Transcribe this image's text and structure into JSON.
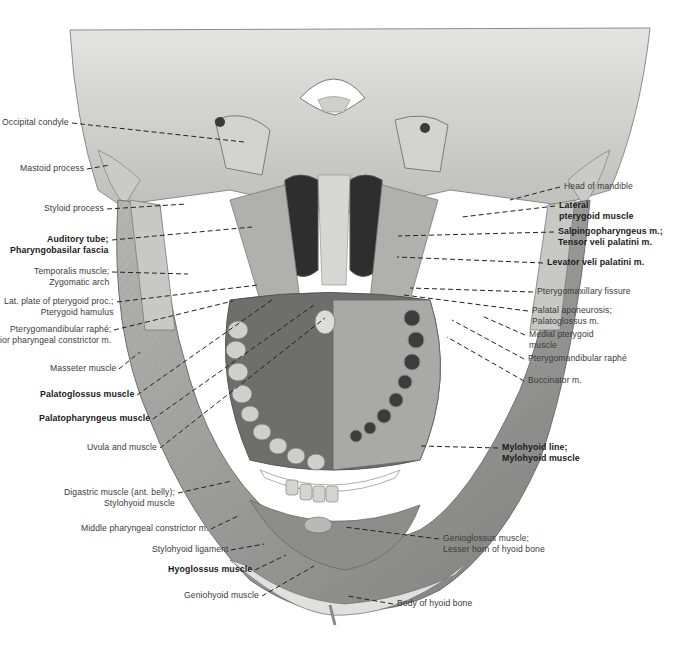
{
  "figure": {
    "colors": {
      "background": "#ffffff",
      "bone": "#d9d9d6",
      "muscle": "#9a9a9a",
      "shadow": "#2b2b2b",
      "text": "#3a3a3a",
      "leader": "#222222"
    }
  },
  "labels_left": [
    {
      "id": "occipital-condyle",
      "lines": [
        "Occipital condyle"
      ],
      "bold": false,
      "x": 2,
      "y": 117,
      "tx": 244,
      "ty": 142
    },
    {
      "id": "mastoid-process",
      "lines": [
        "Mastoid process"
      ],
      "bold": false,
      "x": 20,
      "y": 163,
      "tx": 110,
      "ty": 165
    },
    {
      "id": "styloid-process",
      "lines": [
        "Styloid process"
      ],
      "bold": false,
      "x": 44,
      "y": 203,
      "tx": 187,
      "ty": 204
    },
    {
      "id": "auditory-tube",
      "lines": [
        "Auditory tube;",
        "Pharyngobasilar fascia"
      ],
      "bold": true,
      "x": 10,
      "y": 234,
      "tx": 252,
      "ty": 227
    },
    {
      "id": "temporalis-muscle",
      "lines": [
        "Temporalis muscle;",
        "Zygomatic arch"
      ],
      "bold": false,
      "x": 34,
      "y": 266,
      "tx": 188,
      "ty": 274
    },
    {
      "id": "lat-plate-pterygoid",
      "lines": [
        "Lat. plate of pterygoid proc.;",
        "Pterygoid hamulus"
      ],
      "bold": false,
      "x": 4,
      "y": 296,
      "tx": 258,
      "ty": 285
    },
    {
      "id": "pterygomandibular-raphe-left",
      "lines": [
        "Pterygomandibular raphé;",
        "ior pharyngeal constrictor m."
      ],
      "bold": false,
      "x": 0,
      "y": 324,
      "tx": 233,
      "ty": 301
    },
    {
      "id": "masseter-muscle",
      "lines": [
        "Masseter muscle"
      ],
      "bold": false,
      "x": 50,
      "y": 363,
      "tx": 140,
      "ty": 352
    },
    {
      "id": "palatoglossus-muscle",
      "lines": [
        "Palatoglossus muscle"
      ],
      "bold": true,
      "x": 40,
      "y": 389,
      "tx": 272,
      "ty": 300
    },
    {
      "id": "palatopharyngeus-muscle",
      "lines": [
        "Palatopharyngeus muscle"
      ],
      "bold": true,
      "x": 39,
      "y": 413,
      "tx": 314,
      "ty": 305
    },
    {
      "id": "uvula-and-muscle",
      "lines": [
        "Uvula and muscle"
      ],
      "bold": false,
      "x": 87,
      "y": 442,
      "tx": 325,
      "ty": 318
    },
    {
      "id": "digastric-muscle",
      "lines": [
        "Digastric muscle (ant. belly);",
        "Stylohyoid muscle"
      ],
      "bold": false,
      "x": 64,
      "y": 487,
      "tx": 232,
      "ty": 481
    },
    {
      "id": "middle-pharyngeal-constrictor",
      "lines": [
        "Middle pharyngeal constrictor m."
      ],
      "bold": false,
      "x": 81,
      "y": 523,
      "tx": 240,
      "ty": 515
    },
    {
      "id": "stylohyoid-ligament",
      "lines": [
        "Stylohyoid ligament"
      ],
      "bold": false,
      "x": 152,
      "y": 544,
      "tx": 264,
      "ty": 544
    },
    {
      "id": "hyoglossus-muscle",
      "lines": [
        "Hyoglossus muscle"
      ],
      "bold": true,
      "x": 168,
      "y": 564,
      "tx": 286,
      "ty": 555
    },
    {
      "id": "geniohyoid-muscle",
      "lines": [
        "Geniohyoid muscle"
      ],
      "bold": false,
      "x": 184,
      "y": 590,
      "tx": 314,
      "ty": 566
    }
  ],
  "labels_right": [
    {
      "id": "head-of-mandible",
      "lines": [
        "Head of mandible"
      ],
      "bold": false,
      "x": 564,
      "y": 181,
      "tx": 510,
      "ty": 200
    },
    {
      "id": "lateral-pterygoid-muscle",
      "lines": [
        "Lateral",
        "pterygoid muscle"
      ],
      "bold": true,
      "x": 559,
      "y": 200,
      "tx": 462,
      "ty": 217
    },
    {
      "id": "salpingopharyngeus",
      "lines": [
        "Salpingopharyngeus m.;",
        "Tensor veli palatini m."
      ],
      "bold": true,
      "x": 558,
      "y": 226,
      "tx": 398,
      "ty": 236
    },
    {
      "id": "levator-veli-palatini",
      "lines": [
        "Levator veli palatini m."
      ],
      "bold": true,
      "x": 547,
      "y": 257,
      "tx": 397,
      "ty": 257
    },
    {
      "id": "pterygomaxillary-fissure",
      "lines": [
        "Pterygomaxillary fissure"
      ],
      "bold": false,
      "x": 537,
      "y": 286,
      "tx": 410,
      "ty": 288
    },
    {
      "id": "palatal-aponeurosis",
      "lines": [
        "Palatal aponeurosis;",
        "Palatoglossus m."
      ],
      "bold": false,
      "x": 532,
      "y": 305,
      "tx": 404,
      "ty": 295
    },
    {
      "id": "medial-pterygoid-muscle",
      "lines": [
        "Medial pterygoid",
        "muscle"
      ],
      "bold": false,
      "x": 529,
      "y": 329,
      "tx": 482,
      "ty": 316
    },
    {
      "id": "pterygomandibular-raphe-right",
      "lines": [
        "Pterygomandibular raphé"
      ],
      "bold": false,
      "x": 528,
      "y": 353,
      "tx": 452,
      "ty": 320
    },
    {
      "id": "buccinator",
      "lines": [
        "Buccinator m."
      ],
      "bold": false,
      "x": 528,
      "y": 375,
      "tx": 447,
      "ty": 337
    },
    {
      "id": "mylohyoid-line",
      "lines": [
        "Mylohyoid line;",
        "Mylohyoid muscle"
      ],
      "bold": true,
      "x": 502,
      "y": 442,
      "tx": 421,
      "ty": 446
    },
    {
      "id": "genioglossus-muscle",
      "lines": [
        "Genioglossus muscle;",
        "Lesser horn of hyoid bone"
      ],
      "bold": false,
      "x": 443,
      "y": 533,
      "tx": 344,
      "ty": 527
    },
    {
      "id": "body-of-hyoid-bone",
      "lines": [
        "Body of hyoid bone"
      ],
      "bold": false,
      "x": 397,
      "y": 598,
      "tx": 348,
      "ty": 596
    }
  ]
}
